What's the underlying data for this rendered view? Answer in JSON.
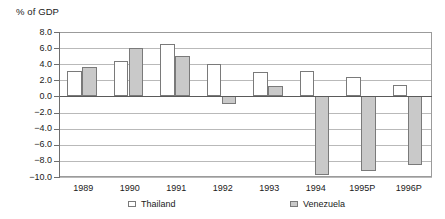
{
  "chart_data": {
    "type": "bar",
    "title": "% of GDP",
    "xlabel": "",
    "ylabel": "% of GDP",
    "ylim": [
      -10.0,
      8.0
    ],
    "ytick_step": 2.0,
    "grid": true,
    "legend_position": "bottom",
    "categories": [
      "1989",
      "1990",
      "1991",
      "1992",
      "1993",
      "1994",
      "1995P",
      "1996P"
    ],
    "ytick_labels": [
      "8.0",
      "6.0",
      "4.0",
      "2.0",
      "0.0",
      "-2.0",
      "-4.0",
      "-6.0",
      "-8.0",
      "-10.0"
    ],
    "ytick_values": [
      8.0,
      6.0,
      4.0,
      2.0,
      0.0,
      -2.0,
      -4.0,
      -6.0,
      -8.0,
      -10.0
    ],
    "series": [
      {
        "name": "Thailand",
        "color": "#ffffff",
        "values": [
          3.2,
          4.4,
          6.5,
          4.0,
          3.0,
          3.2,
          2.4,
          1.4
        ]
      },
      {
        "name": "Venezuela",
        "color": "#c9c9c9",
        "values": [
          3.6,
          6.0,
          5.0,
          -1.0,
          1.3,
          -9.7,
          -9.2,
          -8.5
        ]
      }
    ]
  },
  "legend": {
    "entries": [
      {
        "label": "Thailand",
        "swatch": "thailand"
      },
      {
        "label": "Venezuela",
        "swatch": "venezuela"
      }
    ]
  }
}
